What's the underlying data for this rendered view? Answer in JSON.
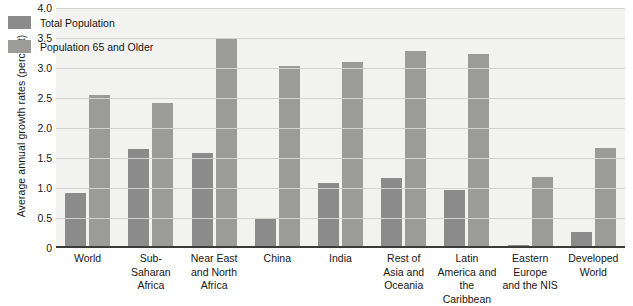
{
  "chart_data": {
    "type": "bar",
    "title": "",
    "xlabel": "",
    "ylabel": "Average annual growth rates (percent)",
    "ylim": [
      0,
      4.0
    ],
    "yticks": [
      "0",
      "0.5",
      "1.0",
      "1.5",
      "2.0",
      "2.5",
      "3.0",
      "3.5",
      "4.0"
    ],
    "grid": true,
    "legend_position": "top-left",
    "categories": [
      "World",
      "Sub-Saharan\nAfrica",
      "Near East\nand North\nAfrica",
      "China",
      "India",
      "Rest of\nAsia and\nOceania",
      "Latin\nAmerica and\nthe Caribbean",
      "Eastern\nEurope\nand the NIS",
      "Developed\nWorld"
    ],
    "series": [
      {
        "name": "Total Population",
        "color": "#8b8b8b",
        "values": [
          0.92,
          1.65,
          1.58,
          0.48,
          1.08,
          1.17,
          0.97,
          0.05,
          0.27
        ]
      },
      {
        "name": "Population 65 and Older",
        "color": "#9b9b9a",
        "values": [
          2.55,
          2.41,
          3.49,
          3.04,
          3.1,
          3.29,
          3.24,
          1.19,
          1.66
        ]
      }
    ]
  }
}
